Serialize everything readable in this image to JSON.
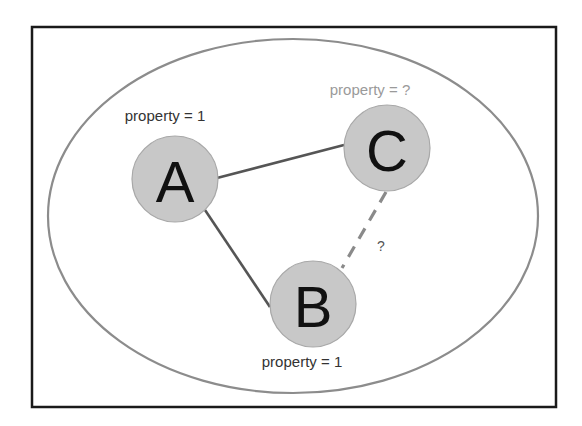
{
  "diagram": {
    "nodes": [
      {
        "id": "A",
        "letter": "A",
        "property_label": "property = 1",
        "property_known": true
      },
      {
        "id": "B",
        "letter": "B",
        "property_label": "property = 1",
        "property_known": true
      },
      {
        "id": "C",
        "letter": "C",
        "property_label": "property = ?",
        "property_known": false
      }
    ],
    "edges": [
      {
        "from": "A",
        "to": "C",
        "style": "solid",
        "label": ""
      },
      {
        "from": "A",
        "to": "B",
        "style": "solid",
        "label": ""
      },
      {
        "from": "C",
        "to": "B",
        "style": "dashed",
        "label": "?"
      }
    ],
    "colors": {
      "node_fill": "#c8c8c8",
      "known_label": "#333333",
      "unknown_label": "#9a9a9a",
      "solid_edge": "#555555",
      "dashed_edge": "#8a8a8a",
      "group_outline": "#8c8c8c"
    }
  }
}
